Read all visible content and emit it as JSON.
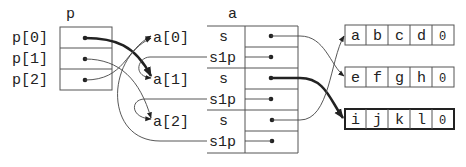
{
  "diagram": {
    "p_array": {
      "name": "p",
      "labels": [
        "p[0]",
        "p[1]",
        "p[2]"
      ]
    },
    "a_refs": {
      "labels": [
        "a[0]",
        "a[1]",
        "a[2]"
      ]
    },
    "a_struct": {
      "name": "a",
      "fields": [
        "s",
        "s1p",
        "s",
        "s1p",
        "s",
        "s1p"
      ]
    },
    "strings": [
      {
        "chars": [
          "a",
          "b",
          "c",
          "d",
          "\\0"
        ],
        "highlighted": false
      },
      {
        "chars": [
          "e",
          "f",
          "g",
          "h",
          "\\0"
        ],
        "highlighted": false
      },
      {
        "chars": [
          "i",
          "j",
          "k",
          "l",
          "\\0"
        ],
        "highlighted": true
      }
    ],
    "null_glyph": "0"
  }
}
